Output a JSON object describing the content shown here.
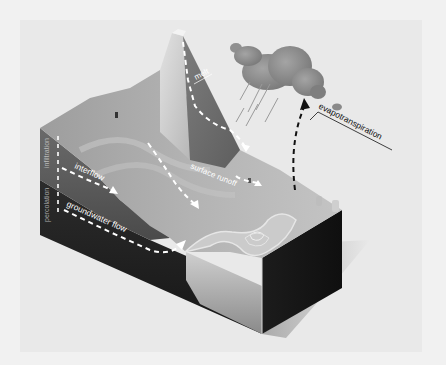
{
  "diagram": {
    "type": "hydrologic-cycle-block-diagram",
    "colors": {
      "background": "#f1f1f1",
      "panel": "#e9e9e9",
      "mountain_light": "#c9c9c9",
      "mountain_dark": "#6f6f6f",
      "terrain_top": "#a9a9a9",
      "soil_layer": "#5a5a5a",
      "bedrock": "#222222",
      "water": "#bdbdbd",
      "cloud": "#8c8c8c",
      "arrow": "#ffffff",
      "label_dark": "#111111"
    },
    "labels": {
      "melt": "melt",
      "evapotranspiration": "evapotranspiration",
      "surface_runoff": "surface runoff",
      "infiltration": "infiltration",
      "interflow": "interflow",
      "percolation": "percolation",
      "groundwater_flow": "groundwater flow"
    }
  }
}
